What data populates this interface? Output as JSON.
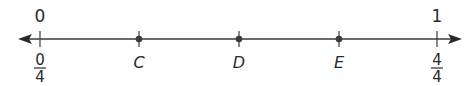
{
  "number_line": {
    "line_color": "#3a3a3a",
    "top_labels": {
      "start": "0",
      "end": "1"
    },
    "bottom_labels": {
      "start": {
        "numerator": "0",
        "denominator": "4"
      },
      "end": {
        "numerator": "4",
        "denominator": "4"
      }
    },
    "points": [
      {
        "label": "C"
      },
      {
        "label": "D"
      },
      {
        "label": "E"
      }
    ]
  }
}
